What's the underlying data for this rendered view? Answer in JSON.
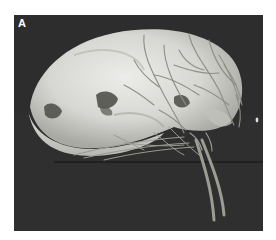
{
  "figure": {
    "panel_label": "A",
    "colors": {
      "background": "#2f2f2f",
      "bone": "#d9d9d4",
      "bone_shadow": "#9a9a94",
      "vessel": "#a8a8a0",
      "label": "#ffffff",
      "page": "#ffffff"
    }
  }
}
